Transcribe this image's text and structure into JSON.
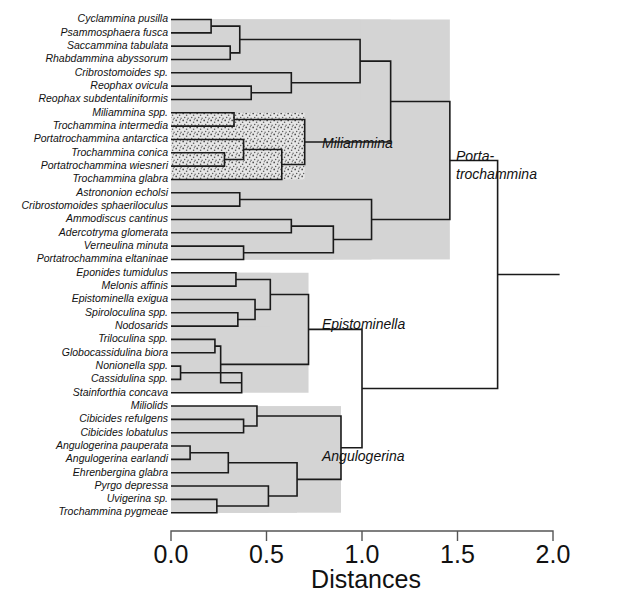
{
  "figure": {
    "title": "",
    "background_color": "#ffffff",
    "line_color": "#1a1a1a",
    "shade_color": "#d4d4d4",
    "stipple_color": "#dcdcdc"
  },
  "axis": {
    "label": "Distances",
    "ticks": [
      "0.0",
      "0.5",
      "1.0",
      "1.5",
      "2.0"
    ],
    "tick_values": [
      0.0,
      0.5,
      1.0,
      1.5,
      2.0
    ],
    "range": [
      0.0,
      2.0
    ]
  },
  "group_labels": [
    {
      "text": "Miliammina",
      "id": "miliammina"
    },
    {
      "text": "Porta-",
      "id": "portatrochammina-line1"
    },
    {
      "text": "trochammina",
      "id": "portatrochammina-line2"
    },
    {
      "text": "Epistominella",
      "id": "epistominella"
    },
    {
      "text": "Angulogerina",
      "id": "angulogerina"
    }
  ],
  "chart_data": {
    "type": "dendrogram",
    "title": "",
    "xlabel": "Distances",
    "ylabel": "",
    "xlim": [
      0.0,
      2.0
    ],
    "grid": false,
    "legend": "none",
    "orientation": "horizontal-right",
    "leaves": [
      "Cyclammina pusilla",
      "Psammosphaera fusca",
      "Saccammina tabulata",
      "Rhabdammina abyssorum",
      "Cribrostomoides sp.",
      "Reophax ovicula",
      "Reophax subdentaliniformis",
      "Miliammina spp.",
      "Trochammina intermedia",
      "Portatrochammina antarctica",
      "Trochammina conica",
      "Portatrochammina wiesneri",
      "Trochammina glabra",
      "Astrononion echolsi",
      "Cribrostomoides sphaeriloculus",
      "Ammodiscus cantinus",
      "Adercotryma glomerata",
      "Verneulina minuta",
      "Portatrochammina eltaninae",
      "Eponides tumidulus",
      "Melonis affinis",
      "Epistominella exigua",
      "Spiroloculina spp.",
      "Nodosarids",
      "Triloculina spp.",
      "Globocassidulina biora",
      "Nonionella spp.",
      "Cassidulina spp.",
      "Stainforthia concava",
      "Miliolids",
      "Cibicides refulgens",
      "Cibicides lobatulus",
      "Angulogerina pauperata",
      "Angulogerina earlandi",
      "Ehrenbergina glabra",
      "Pyrgo depressa",
      "Uvigerina sp.",
      "Trochammina pygmeae"
    ],
    "merges": [
      {
        "id": "m1",
        "left": "Cyclammina pusilla",
        "right": "Psammosphaera fusca",
        "distance": 0.21
      },
      {
        "id": "m2",
        "left": "Saccammina tabulata",
        "right": "Rhabdammina abyssorum",
        "distance": 0.31
      },
      {
        "id": "m3",
        "left": "m1",
        "right": "m2",
        "distance": 0.36
      },
      {
        "id": "m4",
        "left": "Reophax ovicula",
        "right": "Reophax subdentaliniformis",
        "distance": 0.42
      },
      {
        "id": "m5",
        "left": "Cribrostomoides sp.",
        "right": "m4",
        "distance": 0.63
      },
      {
        "id": "m6",
        "left": "m3",
        "right": "m5",
        "distance": 0.99
      },
      {
        "id": "m7",
        "left": "Miliammina spp.",
        "right": "Trochammina intermedia",
        "distance": 0.33
      },
      {
        "id": "m8",
        "left": "Trochammina conica",
        "right": "Portatrochammina wiesneri",
        "distance": 0.28
      },
      {
        "id": "m9",
        "left": "Portatrochammina antarctica",
        "right": "m8",
        "distance": 0.38
      },
      {
        "id": "m10",
        "left": "m9",
        "right": "Trochammina glabra",
        "distance": 0.58
      },
      {
        "id": "m11",
        "left": "m7",
        "right": "m10",
        "distance": 0.7
      },
      {
        "id": "m12",
        "left": "m6",
        "right": "m11",
        "distance": 1.15
      },
      {
        "id": "m13",
        "left": "Astrononion echolsi",
        "right": "Cribrostomoides sphaeriloculus",
        "distance": 0.36
      },
      {
        "id": "m14",
        "left": "Verneulina minuta",
        "right": "Portatrochammina eltaninae",
        "distance": 0.38
      },
      {
        "id": "m15",
        "left": "Ammodiscus cantinus",
        "right": "Adercotryma glomerata",
        "distance": 0.63
      },
      {
        "id": "m16",
        "left": "m15",
        "right": "m14",
        "distance": 0.85
      },
      {
        "id": "m17",
        "left": "m13",
        "right": "m16",
        "distance": 1.05
      },
      {
        "id": "m18",
        "left": "m12",
        "right": "m17",
        "distance": 1.46
      },
      {
        "id": "m19",
        "left": "Eponides tumidulus",
        "right": "Melonis affinis",
        "distance": 0.34
      },
      {
        "id": "m20",
        "left": "Spiroloculina spp.",
        "right": "Nodosarids",
        "distance": 0.35
      },
      {
        "id": "m21",
        "left": "Epistominella exigua",
        "right": "m20",
        "distance": 0.44
      },
      {
        "id": "m22",
        "left": "m19",
        "right": "m21",
        "distance": 0.52
      },
      {
        "id": "m23",
        "left": "Triloculina spp.",
        "right": "Globocassidulina biora",
        "distance": 0.23
      },
      {
        "id": "m24",
        "left": "Nonionella spp.",
        "right": "Cassidulina spp.",
        "distance": 0.05
      },
      {
        "id": "m25",
        "left": "m24",
        "right": "Stainforthia concava",
        "distance": 0.37
      },
      {
        "id": "m26",
        "left": "m23",
        "right": "m25",
        "distance": 0.26
      },
      {
        "id": "m27",
        "left": "m22",
        "right": "m26",
        "distance": 0.72
      },
      {
        "id": "m28",
        "left": "Cibicides refulgens",
        "right": "Cibicides lobatulus",
        "distance": 0.38
      },
      {
        "id": "m29",
        "left": "Miliolids",
        "right": "m28",
        "distance": 0.45
      },
      {
        "id": "m30",
        "left": "Angulogerina pauperata",
        "right": "Angulogerina earlandi",
        "distance": 0.1
      },
      {
        "id": "m31",
        "left": "m30",
        "right": "Ehrenbergina glabra",
        "distance": 0.3
      },
      {
        "id": "m32",
        "left": "Uvigerina sp.",
        "right": "Trochammina pygmeae",
        "distance": 0.24
      },
      {
        "id": "m33",
        "left": "Pyrgo depressa",
        "right": "m32",
        "distance": 0.51
      },
      {
        "id": "m34",
        "left": "m31",
        "right": "m33",
        "distance": 0.66
      },
      {
        "id": "m35",
        "left": "m29",
        "right": "m34",
        "distance": 0.89
      },
      {
        "id": "m36",
        "left": "m27",
        "right": "m35",
        "distance": 1.0
      },
      {
        "id": "m37",
        "left": "m18",
        "right": "m36",
        "distance": 1.71
      }
    ],
    "shaded_clusters": [
      {
        "node": "m18",
        "style": "solid-gray"
      },
      {
        "node": "m27",
        "style": "solid-gray"
      },
      {
        "node": "m35",
        "style": "solid-gray"
      },
      {
        "node": "m11",
        "style": "stipple"
      }
    ]
  }
}
